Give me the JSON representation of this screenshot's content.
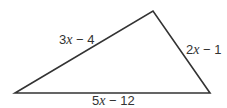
{
  "figure": {
    "type": "triangle",
    "stroke_color": "#333333",
    "fill_color": "#ffffff",
    "vertices": {
      "left": [
        15,
        93
      ],
      "top": [
        153,
        11
      ],
      "right": [
        210,
        93
      ]
    },
    "sides": {
      "left_side": {
        "coef": "3",
        "var": "x",
        "rest": " − 4",
        "full": "3x − 4"
      },
      "right_side": {
        "coef": "2",
        "var": "x",
        "rest": " − 1",
        "full": "2x − 1"
      },
      "base": {
        "coef": "5",
        "var": "x",
        "rest": " − 12",
        "full": "5x − 12"
      }
    }
  }
}
